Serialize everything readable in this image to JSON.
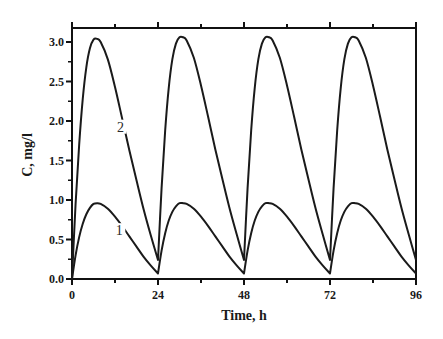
{
  "chart_data": {
    "type": "line",
    "title": "",
    "xlabel": "Time, h",
    "ylabel": "C, mg/l",
    "xlim": [
      0,
      96
    ],
    "ylim": [
      0,
      3.2
    ],
    "xticks": [
      0,
      24,
      48,
      72,
      96
    ],
    "xtick_labels": [
      "0",
      "24",
      "48",
      "72",
      "96"
    ],
    "x_minor_ticks": [
      12,
      36,
      60,
      84
    ],
    "yticks": [
      0.0,
      0.5,
      1.0,
      1.5,
      2.0,
      2.5,
      3.0
    ],
    "ytick_labels": [
      "0.0",
      "0.5",
      "1.0",
      "1.5",
      "2.0",
      "2.5",
      "3.0"
    ],
    "y_minor_step": 0.25,
    "grid": false,
    "legend": "none (curves labeled inline)",
    "series": [
      {
        "name": "1",
        "label_position": {
          "t": 13.2,
          "c": 0.58
        },
        "dosing_interval_h": 24,
        "peak_time_after_dose_h": 6.5,
        "peaks": [
          0.96,
          0.96,
          0.96,
          0.96
        ],
        "troughs": [
          0.07,
          0.07,
          0.07,
          0.07
        ],
        "x": [
          0,
          1,
          2,
          3,
          4,
          5,
          6,
          7,
          8,
          10,
          12,
          14,
          16,
          18,
          20,
          22,
          24,
          25,
          26,
          27,
          28,
          29,
          30,
          31,
          32,
          34,
          36,
          38,
          40,
          42,
          44,
          46,
          48,
          49,
          50,
          51,
          52,
          53,
          54,
          55,
          56,
          58,
          60,
          62,
          64,
          66,
          68,
          70,
          72,
          73,
          74,
          75,
          76,
          77,
          78,
          79,
          80,
          82,
          84,
          86,
          88,
          90,
          92,
          94,
          96
        ],
        "values": [
          0.0,
          0.3,
          0.53,
          0.7,
          0.82,
          0.9,
          0.95,
          0.96,
          0.95,
          0.89,
          0.79,
          0.67,
          0.54,
          0.41,
          0.28,
          0.17,
          0.07,
          0.36,
          0.58,
          0.74,
          0.85,
          0.92,
          0.96,
          0.96,
          0.95,
          0.89,
          0.79,
          0.67,
          0.54,
          0.41,
          0.28,
          0.17,
          0.07,
          0.36,
          0.58,
          0.74,
          0.85,
          0.92,
          0.96,
          0.96,
          0.95,
          0.89,
          0.79,
          0.67,
          0.54,
          0.41,
          0.28,
          0.17,
          0.07,
          0.36,
          0.58,
          0.74,
          0.85,
          0.92,
          0.96,
          0.96,
          0.95,
          0.89,
          0.79,
          0.67,
          0.54,
          0.41,
          0.28,
          0.17,
          0.07
        ]
      },
      {
        "name": "2",
        "label_position": {
          "t": 13.5,
          "c": 1.89
        },
        "dosing_interval_h": 24,
        "peak_time_after_dose_h": 7,
        "peaks": [
          3.04,
          3.06,
          3.06,
          3.06
        ],
        "troughs": [
          0.24,
          0.24,
          0.24,
          0.24
        ],
        "x": [
          0,
          1,
          2,
          3,
          4,
          5,
          6,
          7,
          8,
          10,
          12,
          14,
          16,
          18,
          20,
          22,
          24,
          25,
          26,
          27,
          28,
          29,
          30,
          31,
          32,
          34,
          36,
          38,
          40,
          42,
          44,
          46,
          48,
          49,
          50,
          51,
          52,
          53,
          54,
          55,
          56,
          58,
          60,
          62,
          64,
          66,
          68,
          70,
          72,
          73,
          74,
          75,
          76,
          77,
          78,
          79,
          80,
          82,
          84,
          86,
          88,
          90,
          92,
          94,
          96
        ],
        "values": [
          0.0,
          0.95,
          1.7,
          2.28,
          2.68,
          2.92,
          3.03,
          3.04,
          3.0,
          2.78,
          2.43,
          2.03,
          1.63,
          1.25,
          0.88,
          0.55,
          0.24,
          1.15,
          1.88,
          2.42,
          2.78,
          2.98,
          3.06,
          3.06,
          3.02,
          2.8,
          2.45,
          2.05,
          1.64,
          1.26,
          0.89,
          0.56,
          0.24,
          1.15,
          1.88,
          2.42,
          2.78,
          2.98,
          3.06,
          3.06,
          3.02,
          2.8,
          2.45,
          2.05,
          1.64,
          1.26,
          0.89,
          0.56,
          0.24,
          1.15,
          1.88,
          2.42,
          2.78,
          2.98,
          3.06,
          3.06,
          3.02,
          2.8,
          2.45,
          2.05,
          1.64,
          1.26,
          0.89,
          0.56,
          0.24
        ]
      }
    ]
  },
  "layout": {
    "plot_left": 72,
    "plot_right": 416,
    "plot_top": 28,
    "plot_bottom": 279,
    "y_unit_px": 79,
    "line_color": "#1a1a1a",
    "axis_color": "#111111"
  }
}
